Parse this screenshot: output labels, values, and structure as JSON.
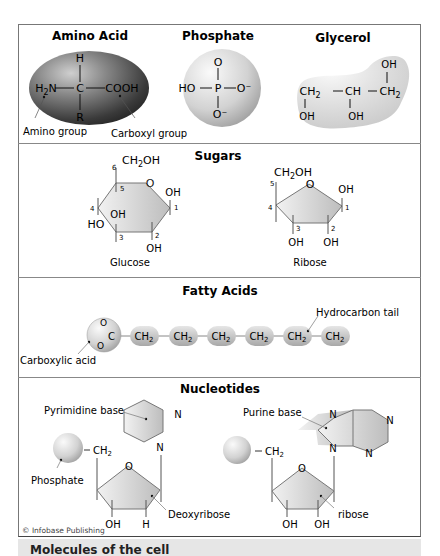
{
  "sections": {
    "top": {
      "amino_acid": {
        "title": "Amino Acid",
        "atoms": {
          "top": "H",
          "left": "H2N",
          "center": "C",
          "right": "COOH",
          "bottom": "R"
        },
        "labels": {
          "amino_group": "Amino group",
          "carboxyl_group": "Carboxyl group"
        }
      },
      "phosphate": {
        "title": "Phosphate",
        "atoms": {
          "top": "O",
          "left": "HO",
          "center": "P",
          "right": "O⁻",
          "bottom": "O⁻"
        }
      },
      "glycerol": {
        "title": "Glycerol",
        "atoms": {
          "c1": "CH2",
          "c2": "CH",
          "c3": "CH2",
          "oh1": "OH",
          "oh2": "OH",
          "oh3": "OH"
        }
      }
    },
    "sugars": {
      "title": "Sugars",
      "glucose": {
        "name": "Glucose",
        "groups": {
          "ch2oh": "CH2OH",
          "ring_o": "O",
          "oh1": "OH",
          "oh2": "OH",
          "oh3": "OH",
          "ho4": "HO"
        },
        "carbon_numbers": [
          "1",
          "2",
          "3",
          "4",
          "5",
          "6"
        ]
      },
      "ribose": {
        "name": "Ribose",
        "groups": {
          "ch2oh": "CH2OH",
          "ring_o": "O",
          "oh1": "OH",
          "oh2": "OH",
          "oh3": "OH"
        },
        "carbon_numbers": [
          "1",
          "2",
          "3",
          "4",
          "5"
        ]
      }
    },
    "fatty_acids": {
      "title": "Fatty Acids",
      "head": {
        "o1": "O",
        "o2": "O",
        "c": "C"
      },
      "chain": [
        "CH2",
        "CH2",
        "CH2",
        "CH2",
        "CH2",
        "CH2"
      ],
      "labels": {
        "carboxylic_acid": "Carboxylic acid",
        "hydrocarbon_tail": "Hydrocarbon tail"
      }
    },
    "nucleotides": {
      "title": "Nucleotides",
      "left": {
        "base_label": "Pyrimidine base",
        "phosphate_label": "Phosphate",
        "sugar_label": "Deoxyribose",
        "ch2": "CH2",
        "ring_o": "O",
        "n_top": "N",
        "n_bottom": "N",
        "oh": "OH",
        "h": "H"
      },
      "right": {
        "base_label": "Purine base",
        "sugar_label": "ribose",
        "ch2": "CH2",
        "ring_o": "O",
        "n1": "N",
        "n2": "N",
        "n3": "N",
        "n4": "N",
        "oh1": "OH",
        "oh2": "OH"
      },
      "copyright": "© Infobase Publishing"
    }
  },
  "caption": {
    "title": "Molecules of the cell",
    "subtitle": "Include amino acids, phosphate..."
  },
  "colors": {
    "frame": "#777777",
    "shape_fill_light": "#e8e8e8",
    "shape_fill_dark": "#444444",
    "caption_bg": "#e6e6e6",
    "text": "#222222"
  }
}
